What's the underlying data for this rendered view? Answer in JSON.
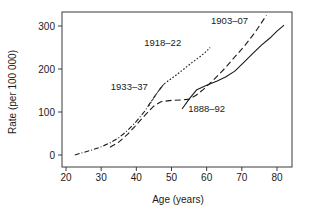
{
  "chart_data": {
    "type": "line",
    "title": "",
    "xlabel": "Age (years)",
    "ylabel": "Rate (per 100 000)",
    "xlim": [
      18,
      84
    ],
    "ylim": [
      -22,
      340
    ],
    "xticks": [
      20,
      30,
      40,
      50,
      60,
      70,
      80
    ],
    "xtick_labels": [
      "20",
      "30",
      "40",
      "50",
      "60",
      "70",
      "80"
    ],
    "yticks": [
      0,
      100,
      200,
      300
    ],
    "ytick_labels": [
      "0",
      "100",
      "200",
      "300"
    ],
    "grid": false,
    "legend": "inline-annotations",
    "series": [
      {
        "name": "1933-37",
        "label": "1933–37",
        "style": "dash-dot",
        "dasharray": "5,2,1,2",
        "label_x": 38.0,
        "label_y": 152,
        "points": [
          [
            22.5,
            0
          ],
          [
            25,
            6
          ],
          [
            27.5,
            12
          ],
          [
            30,
            19
          ],
          [
            32.5,
            28
          ],
          [
            35,
            40
          ],
          [
            37.5,
            57
          ],
          [
            40,
            78
          ],
          [
            42.5,
            103
          ],
          [
            44,
            122
          ],
          [
            45.5,
            140
          ],
          [
            47,
            156
          ],
          [
            48.2,
            168
          ]
        ]
      },
      {
        "name": "1918-22",
        "label": "1918–22",
        "style": "dotted",
        "dasharray": "1.6,1.8",
        "label_x": 47.5,
        "label_y": 253,
        "points": [
          [
            43.5,
            114
          ],
          [
            45,
            133
          ],
          [
            46.5,
            152
          ],
          [
            48,
            166
          ],
          [
            50,
            178
          ],
          [
            52,
            190
          ],
          [
            54,
            203
          ],
          [
            56,
            216
          ],
          [
            58,
            228
          ],
          [
            59.5,
            238
          ],
          [
            61,
            250
          ]
        ]
      },
      {
        "name": "1903-07",
        "label": "1903–07",
        "style": "long-dash",
        "dasharray": "6,3.2",
        "label_x": 66.5,
        "label_y": 305,
        "points": [
          [
            32.5,
            18
          ],
          [
            35,
            30
          ],
          [
            37.5,
            48
          ],
          [
            40,
            70
          ],
          [
            42.5,
            93
          ],
          [
            45,
            114
          ],
          [
            47,
            124
          ],
          [
            50,
            127
          ],
          [
            53,
            128
          ],
          [
            55,
            130
          ],
          [
            57,
            139
          ],
          [
            59,
            152
          ],
          [
            62,
            175
          ],
          [
            65,
            200
          ],
          [
            68,
            228
          ],
          [
            71,
            256
          ],
          [
            74,
            288
          ],
          [
            77,
            325
          ]
        ]
      },
      {
        "name": "1888-92",
        "label": "1888–92",
        "style": "solid",
        "dasharray": "none",
        "label_x": 60.0,
        "label_y": 100,
        "points": [
          [
            53.0,
            107
          ],
          [
            55,
            130
          ],
          [
            57.2,
            152
          ],
          [
            60,
            162
          ],
          [
            63,
            172
          ],
          [
            65.5,
            182
          ],
          [
            68,
            195
          ],
          [
            70.5,
            215
          ],
          [
            73,
            235
          ],
          [
            75.5,
            255
          ],
          [
            78,
            272
          ],
          [
            80,
            288
          ],
          [
            82,
            302
          ]
        ]
      }
    ]
  },
  "axes": {
    "x_title": "Age (years)",
    "y_title": "Rate (per 100 000)"
  }
}
